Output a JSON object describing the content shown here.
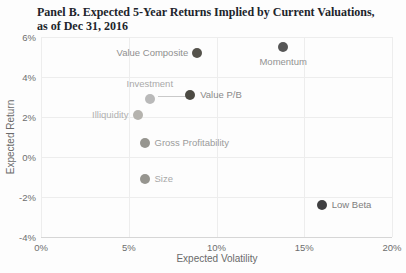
{
  "title": {
    "line1": "Panel B. Expected 5-Year Returns Implied by Current Valuations,",
    "line2": "as of Dec 31, 2016"
  },
  "colors": {
    "background": "#fdfdfd",
    "grid": "#ededed",
    "axis_line": "#d6d6d6",
    "title_text": "#21242b",
    "tick_text": "#6e6e6e",
    "axis_title_text": "#6a6a6a"
  },
  "chart_data": {
    "type": "scatter",
    "title": "Panel B. Expected 5-Year Returns Implied by Current Valuations, as of Dec 31, 2016",
    "xlabel": "Expected Volatility",
    "ylabel": "Expected Return",
    "xlim": [
      0,
      20
    ],
    "ylim": [
      -4,
      6
    ],
    "x_tick_labels": [
      "0%",
      "5%",
      "10%",
      "15%",
      "20%"
    ],
    "x_tick_values": [
      0,
      5,
      10,
      15,
      20
    ],
    "y_tick_labels": [
      "6%",
      "4%",
      "2%",
      "0%",
      "-2%",
      "-4%"
    ],
    "y_tick_values": [
      6,
      4,
      2,
      0,
      -2,
      -4
    ],
    "grid": true,
    "legend": "none",
    "points": [
      {
        "label": "Value Composite",
        "x": 8.9,
        "y": 5.2,
        "color": "#55534c",
        "label_color": "#8f8f8f",
        "label_pos": "left"
      },
      {
        "label": "Momentum",
        "x": 13.8,
        "y": 5.5,
        "color": "#565656",
        "label_color": "#929292",
        "label_pos": "below"
      },
      {
        "label": "Investment",
        "x": 6.2,
        "y": 2.9,
        "color": "#b9b9b9",
        "label_color": "#a9a9a9",
        "label_pos": "above",
        "leader": true
      },
      {
        "label": "Value P/B",
        "x": 8.5,
        "y": 3.1,
        "color": "#4c4a43",
        "label_color": "#8a8a8a",
        "label_pos": "right"
      },
      {
        "label": "Illiquidity",
        "x": 5.5,
        "y": 2.1,
        "color": "#b5b3ae",
        "label_color": "#b0b0b0",
        "label_pos": "left"
      },
      {
        "label": "Gross Profitability",
        "x": 5.9,
        "y": 0.7,
        "color": "#96958f",
        "label_color": "#9b9b9b",
        "label_pos": "right"
      },
      {
        "label": "Size",
        "x": 5.9,
        "y": -1.1,
        "color": "#96958f",
        "label_color": "#a8a8a8",
        "label_pos": "right"
      },
      {
        "label": "Low Beta",
        "x": 16.0,
        "y": -2.4,
        "color": "#3f3f41",
        "label_color": "#7d7d7d",
        "label_pos": "right"
      }
    ]
  }
}
